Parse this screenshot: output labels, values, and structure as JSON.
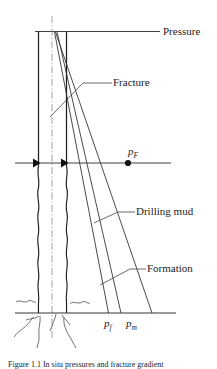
{
  "figure": {
    "type": "technical-line-diagram",
    "background_color": "#ffffff",
    "line_color": "#262626",
    "labels": {
      "pressure": "Pressure",
      "fracture": "Fracture",
      "drilling_mud": "Drilling mud",
      "formation": "Formation",
      "p_fracture_symbol": "p",
      "p_fracture_subscript": "F",
      "p_formation_symbol": "p",
      "p_formation_subscript": "f",
      "p_mud_symbol": "p",
      "p_mud_subscript": "m"
    },
    "caption": "Figure 1.1 In situ pressures and fracture gradient",
    "elements": [
      "top-pressure-axis",
      "wellbore-left-wall",
      "wellbore-right-wall",
      "wellbore-centerline",
      "casing-shoe-arrows",
      "depth-reference-line",
      "fracture-gradient-line",
      "formation-pressure-line",
      "mud-pressure-line",
      "ground-line",
      "root-squiggles"
    ]
  }
}
